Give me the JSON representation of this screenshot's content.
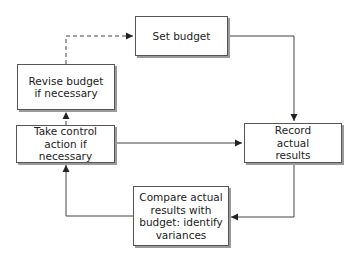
{
  "diagram": {
    "nodes": [
      {
        "id": "set",
        "label": "Set budget"
      },
      {
        "id": "revise",
        "label": "Revise budget if necessary"
      },
      {
        "id": "control",
        "label": "Take control action if necessary"
      },
      {
        "id": "record",
        "label": "Record actual results"
      },
      {
        "id": "compare",
        "label": "Compare actual results with budget: identify variances"
      }
    ],
    "edges": [
      {
        "from": "set",
        "to": "record",
        "style": "solid"
      },
      {
        "from": "record",
        "to": "compare",
        "style": "solid"
      },
      {
        "from": "compare",
        "to": "control",
        "style": "solid"
      },
      {
        "from": "control",
        "to": "record",
        "style": "solid"
      },
      {
        "from": "control",
        "to": "revise",
        "style": "dashed"
      },
      {
        "from": "revise",
        "to": "set",
        "style": "dashed"
      }
    ],
    "colors": {
      "line": "#444444",
      "border": "#555555",
      "shadow": "#9a9a9a",
      "text": "#222222"
    }
  }
}
